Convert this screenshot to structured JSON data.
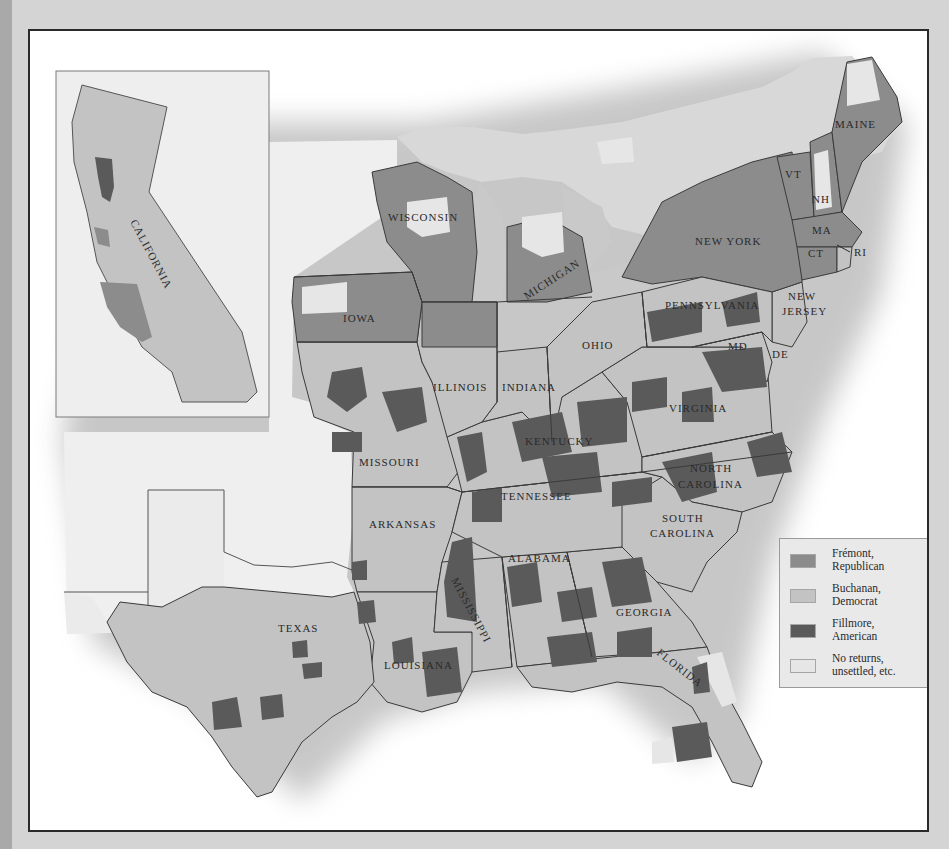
{
  "colors": {
    "republican": "#8c8c8c",
    "democrat": "#c3c3c3",
    "american": "#5a5a5a",
    "no_returns": "#e6e6e6",
    "territory": "#eeeeee",
    "border": "#3a3a3a",
    "frame": "#2a2a2a",
    "page_background": "#d4d4d4"
  },
  "legend": {
    "items": [
      {
        "label_line1": "Frémont,",
        "label_line2": "Republican",
        "color_key": "republican"
      },
      {
        "label_line1": "Buchanan,",
        "label_line2": "Democrat",
        "color_key": "democrat"
      },
      {
        "label_line1": "Fillmore,",
        "label_line2": "American",
        "color_key": "american"
      },
      {
        "label_line1": "No returns,",
        "label_line2": "unsettled, etc.",
        "color_key": "no_returns"
      }
    ]
  },
  "inset": {
    "label": "CALIFORNIA"
  },
  "states": {
    "maine": "MAINE",
    "vermont": "VT",
    "new_hampshire": "NH",
    "massachusetts": "MA",
    "connecticut": "CT",
    "rhode_island": "RI",
    "new_york": "NEW YORK",
    "new_jersey_1": "NEW",
    "new_jersey_2": "JERSEY",
    "pennsylvania": "PENNSYLVANIA",
    "maryland": "MD",
    "delaware": "DE",
    "wisconsin": "WISCONSIN",
    "michigan": "MICHIGAN",
    "iowa": "IOWA",
    "illinois": "ILLINOIS",
    "indiana": "INDIANA",
    "ohio": "OHIO",
    "virginia": "VIRGINIA",
    "kentucky": "KENTUCKY",
    "missouri": "MISSOURI",
    "north_carolina_1": "NORTH",
    "north_carolina_2": "CAROLINA",
    "tennessee": "TENNESSEE",
    "arkansas": "ARKANSAS",
    "south_carolina_1": "SOUTH",
    "south_carolina_2": "CAROLINA",
    "alabama": "ALABAMA",
    "mississippi": "MISSISSIPPI",
    "georgia": "GEORGIA",
    "texas": "TEXAS",
    "louisiana": "LOUISIANA",
    "florida": "FLORIDA"
  }
}
